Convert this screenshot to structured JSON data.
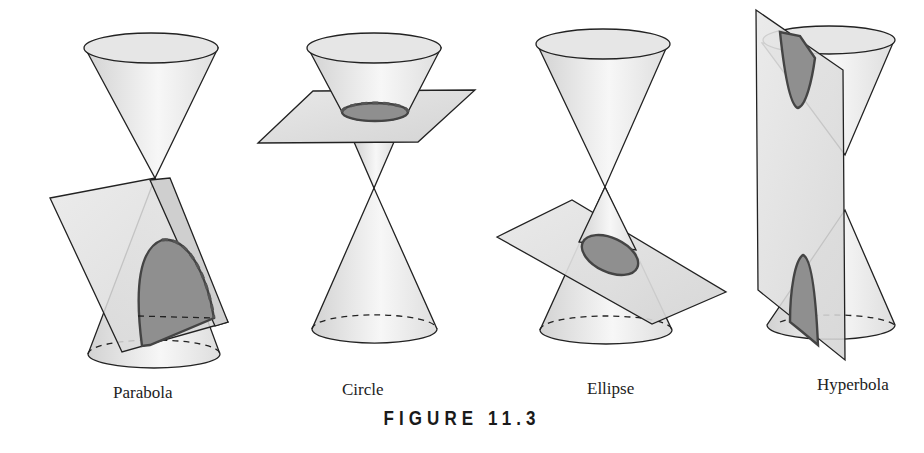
{
  "figure": {
    "title": "FIGURE 11.3",
    "panels": [
      {
        "id": "parabola",
        "label": "Parabola"
      },
      {
        "id": "circle",
        "label": "Circle"
      },
      {
        "id": "ellipse",
        "label": "Ellipse"
      },
      {
        "id": "hyperbola",
        "label": "Hyperbola"
      }
    ]
  },
  "colors": {
    "cone_fill_light": "#f4f4f4",
    "cone_fill_dark": "#d6d6d6",
    "plane_fill": "#dcdcdc",
    "section_fill": "#8f8f8f",
    "stroke": "#222222"
  }
}
